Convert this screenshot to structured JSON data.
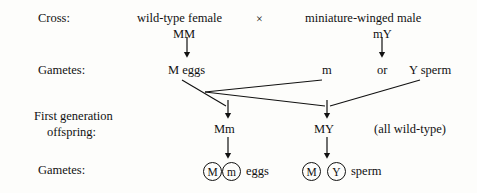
{
  "diagram": {
    "title_row": {
      "label": "Cross:",
      "female_parent": "wild-type female",
      "cross_symbol": "×",
      "male_parent": "miniature-winged male",
      "female_genotype": "MM",
      "male_genotype": "mY"
    },
    "gametes_row_1": {
      "label": "Gametes:",
      "egg_allele": "M eggs",
      "sperm_allele_1": "m",
      "conjunction": "or",
      "sperm_allele_2": "Y sperm"
    },
    "offspring_row": {
      "label_line_1": "First generation",
      "label_line_2": "offspring:",
      "offspring_1": "Mm",
      "offspring_2": "MY",
      "phenotype_note": "(all wild-type)"
    },
    "gametes_row_2": {
      "label": "Gametes:",
      "egg_circle_1": "M",
      "egg_circle_2": "m",
      "egg_caption": "eggs",
      "sperm_circle_1": "M",
      "sperm_circle_2": "Y",
      "sperm_caption": "sperm"
    },
    "colors": {
      "ink": "#111111",
      "background": "#fdfdfb"
    }
  }
}
